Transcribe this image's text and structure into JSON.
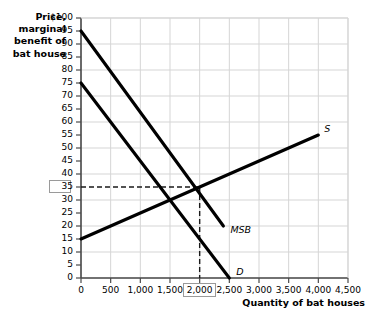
{
  "chart_data": {
    "type": "line",
    "title": "",
    "xlabel": "Quantity of bat houses",
    "ylabel": "Price, marginal benefit of bat house",
    "xlim": [
      0,
      4500
    ],
    "ylim": [
      0,
      100
    ],
    "grid": true,
    "legend_position": "inline-end-of-line",
    "x_ticks": [
      "0",
      "500",
      "1,000",
      "1,500",
      "2,000",
      "2,500",
      "3,000",
      "3,500",
      "4,000",
      "4,500"
    ],
    "x_tick_values": [
      0,
      500,
      1000,
      1500,
      2000,
      2500,
      3000,
      3500,
      4000,
      4500
    ],
    "y_ticks": [
      "0",
      "5",
      "10",
      "15",
      "20",
      "25",
      "30",
      "35",
      "40",
      "45",
      "50",
      "55",
      "60",
      "65",
      "70",
      "75",
      "80",
      "85",
      "90",
      "95",
      "$100"
    ],
    "y_tick_values": [
      0,
      5,
      10,
      15,
      20,
      25,
      30,
      35,
      40,
      45,
      50,
      55,
      60,
      65,
      70,
      75,
      80,
      85,
      90,
      95,
      100
    ],
    "highlighted_y_tick": "35",
    "highlighted_x_tick": "2,000",
    "series": [
      {
        "name": "MSB",
        "label": "MSB",
        "description": "marginal social benefit curve, downward sloping",
        "points": [
          [
            0,
            95
          ],
          [
            2400,
            20
          ]
        ]
      },
      {
        "name": "D",
        "label": "D",
        "description": "demand curve, downward sloping",
        "points": [
          [
            0,
            75
          ],
          [
            2500,
            0
          ]
        ]
      },
      {
        "name": "S",
        "label": "S",
        "description": "supply curve, upward sloping",
        "points": [
          [
            0,
            15
          ],
          [
            4000,
            55
          ]
        ]
      }
    ],
    "annotations": [
      {
        "name": "socially-optimal-point",
        "description": "dashed guide lines from MSB and S intersection",
        "x": 2000,
        "y": 35
      }
    ],
    "line_color": "#000000",
    "grid_color": "#d5d5d5",
    "axis_color": "#4a4a4a",
    "box_color": "#9a9a9a"
  },
  "labels": {
    "y_axis_title": "Price, marginal benefit of bat house",
    "x_axis_title": "Quantity of bat houses"
  }
}
